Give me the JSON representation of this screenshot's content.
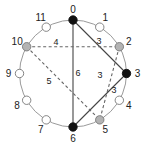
{
  "diagram": {
    "type": "pitch-class-circle",
    "center": [
      73,
      73.5
    ],
    "radius": 53.5,
    "colors": {
      "circle": "#9a9a9a",
      "black_node": "#111111",
      "gray_node": "#b3b3b3",
      "white_node": "#ffffff",
      "node_stroke": "#777777",
      "solid_edge": "#444444",
      "dashed_edge": "#666666"
    },
    "nodes": [
      {
        "id": 0,
        "label": "0",
        "fill": "black"
      },
      {
        "id": 1,
        "label": "1",
        "fill": "white"
      },
      {
        "id": 2,
        "label": "2",
        "fill": "gray"
      },
      {
        "id": 3,
        "label": "3",
        "fill": "black"
      },
      {
        "id": 4,
        "label": "4",
        "fill": "white"
      },
      {
        "id": 5,
        "label": "5",
        "fill": "gray"
      },
      {
        "id": 6,
        "label": "6",
        "fill": "black"
      },
      {
        "id": 7,
        "label": "7",
        "fill": "white"
      },
      {
        "id": 8,
        "label": "8",
        "fill": "white"
      },
      {
        "id": 9,
        "label": "9",
        "fill": "white"
      },
      {
        "id": 10,
        "label": "10",
        "fill": "gray"
      },
      {
        "id": 11,
        "label": "11",
        "fill": "white"
      }
    ],
    "edges": [
      {
        "from": 0,
        "to": 3,
        "style": "solid",
        "label": "3",
        "label_pos": [
          99,
          44
        ]
      },
      {
        "from": 3,
        "to": 6,
        "style": "solid",
        "label": "3",
        "label_pos": [
          114,
          93
        ]
      },
      {
        "from": 0,
        "to": 6,
        "style": "solid",
        "label": "6",
        "label_pos": [
          78,
          76
        ]
      },
      {
        "from": 10,
        "to": 2,
        "style": "dashed",
        "label": "4",
        "label_pos": [
          56,
          45
        ]
      },
      {
        "from": 2,
        "to": 5,
        "style": "dashed",
        "label": "3",
        "label_pos": [
          100,
          78
        ]
      },
      {
        "from": 10,
        "to": 5,
        "style": "dashed",
        "label": "5",
        "label_pos": [
          49,
          84
        ]
      }
    ]
  }
}
